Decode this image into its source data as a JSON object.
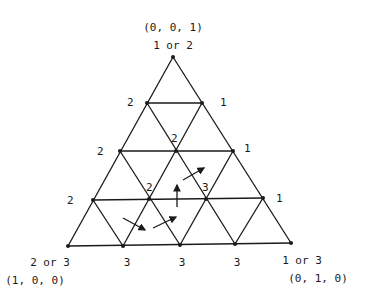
{
  "diagram": {
    "corners": {
      "top": {
        "coord": "(0, 0, 1)",
        "label": "1 or 2"
      },
      "bottom_left": {
        "coord": "(1, 0, 0)",
        "label": "2 or 3"
      },
      "bottom_right": {
        "coord": "(0, 1, 0)",
        "label": "1 or 3"
      }
    },
    "left_edge_labels": [
      "2",
      "2",
      "2"
    ],
    "right_edge_labels": [
      "1",
      "1",
      "1"
    ],
    "bottom_edge_labels": [
      "3",
      "3",
      "3"
    ],
    "interior_labels": [
      "2",
      "2",
      "3"
    ],
    "arrow_count": 4
  }
}
